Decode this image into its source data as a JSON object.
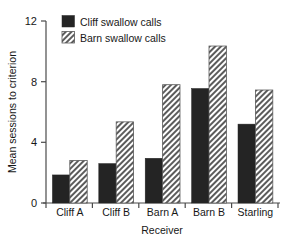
{
  "chart_data": {
    "type": "bar",
    "title": "",
    "xlabel": "Receiver",
    "ylabel": "Mean sessions to criterion",
    "categories": [
      "Cliff A",
      "Cliff B",
      "Barn A",
      "Barn B",
      "Starling"
    ],
    "series": [
      {
        "name": "Cliff swallow calls",
        "values": [
          1.85,
          2.6,
          2.95,
          7.55,
          5.2
        ]
      },
      {
        "name": "Barn swallow calls",
        "values": [
          2.8,
          5.35,
          7.8,
          10.35,
          7.45
        ]
      }
    ],
    "ylim": [
      0,
      12
    ],
    "yticks": [
      0,
      4,
      8,
      12
    ],
    "ytick_labels": [
      "0",
      "4",
      "8",
      "12"
    ],
    "grid": false,
    "legend_position": "top-left",
    "legend": [
      "Cliff swallow calls",
      "Barn swallow calls"
    ],
    "colors": {
      "series_1": "#242424",
      "series_2": "#8c8c8c",
      "axis": "#4a4a4a",
      "background": "#ffffff"
    }
  }
}
